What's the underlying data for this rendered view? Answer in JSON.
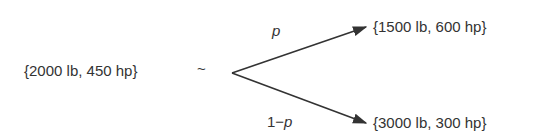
{
  "diagram": {
    "type": "probability-tree",
    "root": {
      "label": "{2000 lb, 450 hp}",
      "relation": "~"
    },
    "branches": [
      {
        "probability_label": "p",
        "outcome": "{1500 lb, 600 hp}"
      },
      {
        "probability_label_prefix": "1−",
        "probability_label_var": "p",
        "outcome": "{3000 lb, 300 hp}"
      }
    ],
    "colors": {
      "ink": "#333333",
      "background": "#ffffff"
    }
  }
}
